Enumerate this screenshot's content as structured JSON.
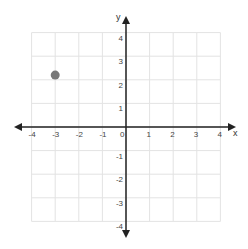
{
  "chart_data": {
    "type": "scatter",
    "title": "",
    "xlabel": "x",
    "ylabel": "y",
    "xlim": [
      -4,
      4
    ],
    "ylim": [
      -4,
      4
    ],
    "grid": true,
    "x_ticks": [
      "-4",
      "-3",
      "-2",
      "-1",
      "0",
      "1",
      "2",
      "3",
      "4"
    ],
    "y_ticks": [
      "4",
      "3",
      "2",
      "1",
      "-1",
      "-2",
      "-3",
      "-4"
    ],
    "points": [
      {
        "x": -3,
        "y": 2.2
      }
    ],
    "colors": {
      "point": "#777777",
      "grid": "#e3e3e3",
      "axis": "#222222"
    }
  }
}
